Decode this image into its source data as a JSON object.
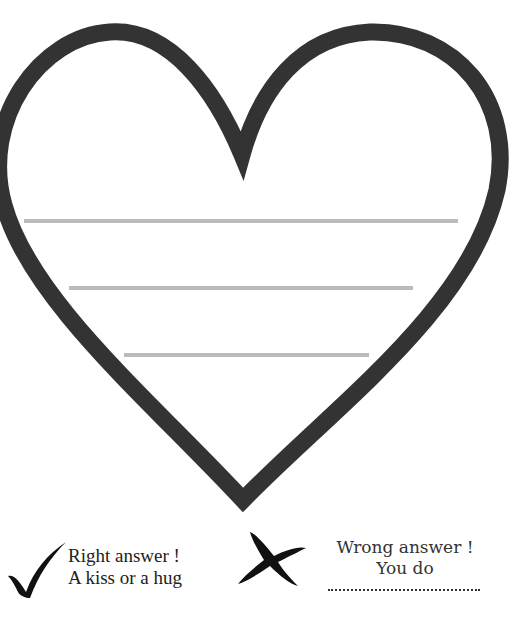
{
  "heart": {
    "stroke_color": "#333333",
    "line_color": "#bbbbbb",
    "writing_lines": [
      {
        "x1": 24,
        "x2": 458,
        "y": 221
      },
      {
        "x1": 69,
        "x2": 413,
        "y": 288
      },
      {
        "x1": 124,
        "x2": 369,
        "y": 355
      }
    ]
  },
  "legend": {
    "right": {
      "icon": "checkmark-icon",
      "line1": "Right answer !",
      "line2": "A kiss or a hug"
    },
    "wrong": {
      "icon": "cross-icon",
      "line1": "Wrong answer !",
      "line2": "You do",
      "blank": "................................"
    }
  }
}
